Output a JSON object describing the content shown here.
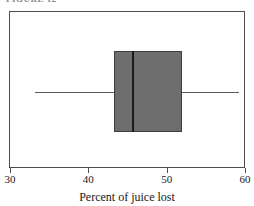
{
  "caption_remnant": "FIGURE 12",
  "chart_data": {
    "type": "box",
    "title": "",
    "xlabel": "Percent of juice lost",
    "ylabel": "",
    "orientation": "horizontal",
    "xlim": [
      30,
      60
    ],
    "xticks": [
      30,
      40,
      50,
      60
    ],
    "xtick_labels": [
      "30",
      "40",
      "50",
      "60"
    ],
    "grid": false,
    "legend": false,
    "series": [
      {
        "name": "Percent of juice lost",
        "whisker_low": 33.1,
        "q1": 43.2,
        "median": 45.6,
        "q3": 51.8,
        "whisker_high": 59.1,
        "outliers": [],
        "box_fill": "#6e6e6e",
        "box_edge": "#3d3d3d",
        "median_color": "#1c1c1c",
        "whisker_color": "#5a5a5a"
      }
    ]
  },
  "plot": {
    "frame_color": "#4d4d4d",
    "background": "#ffffff"
  }
}
